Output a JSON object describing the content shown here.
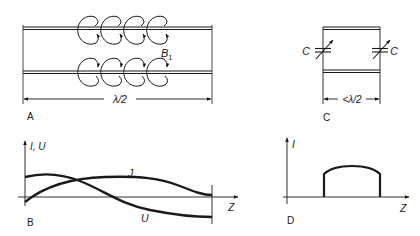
{
  "panels": {
    "A": {
      "label": "A",
      "field_label": "B",
      "field_subscript": "1",
      "dimension": "λ/2",
      "description": "Parallel two-wire line with magnetic field loops"
    },
    "B": {
      "label": "B",
      "y_axis_label": "I, U",
      "x_axis_label": "Z",
      "curve_current_label": "J",
      "curve_voltage_label": "U"
    },
    "C": {
      "label": "C",
      "capacitor_left_label": "C",
      "capacitor_right_label": "C",
      "dimension": "<λ/2"
    },
    "D": {
      "label": "D",
      "y_axis_label": "I",
      "x_axis_label": "Z"
    }
  },
  "colors": {
    "ink": "#1a1a1a",
    "background": "#ffffff"
  }
}
